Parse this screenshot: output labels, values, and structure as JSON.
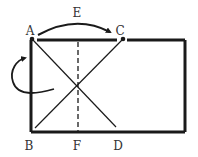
{
  "diagram": {
    "type": "geometric folding diagram",
    "labels": {
      "A": "A",
      "B": "B",
      "C": "C",
      "D": "D",
      "E": "E",
      "F": "F"
    },
    "colors": {
      "stroke": "#1a1a1a",
      "label": "#333333",
      "background": "#ffffff"
    },
    "elements": {
      "rectangle": {
        "x": 31,
        "y": 40,
        "width": 154,
        "height": 92,
        "description": "thick-bordered rectangle"
      },
      "diagonal_AD": {
        "from": "A",
        "to": "D"
      },
      "diagonal_CB": {
        "from": "C",
        "to": "B"
      },
      "dashed_line_EF": {
        "from": "E",
        "to": "F",
        "style": "dashed vertical"
      },
      "arc_arrow_AC": {
        "from": "A",
        "to": "C",
        "description": "curved arrow from A to C over label E"
      },
      "curved_arrow_left": {
        "description": "curved arrow looping around left edge near A, pointing upward"
      }
    }
  }
}
